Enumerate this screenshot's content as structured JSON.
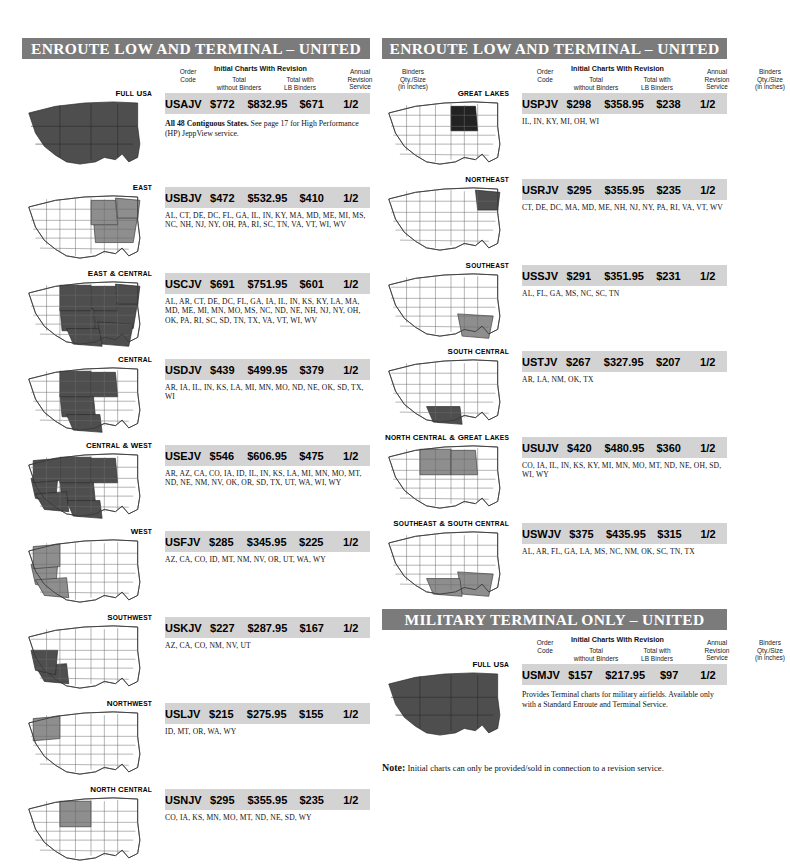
{
  "columns": {
    "header_labels": {
      "order_code": "Order\nCode",
      "order_code_l1": "Order",
      "order_code_l2": "Code",
      "group_title": "Initial Charts With Revision",
      "total_l1": "Total",
      "total_l2": "without  Binders",
      "lb_l1": "Total with",
      "lb_l2": "LB Binders",
      "annual_l1": "Annual",
      "annual_l2": "Revision",
      "annual_l3": "Service",
      "binders_l1": "Binders",
      "binders_l2": "Qty./Size",
      "binders_l3": "(in inches)"
    }
  },
  "sections": [
    {
      "id": "enroute-low-terminal-left",
      "title": "ENROUTE LOW AND TERMINAL – UNITED STATES",
      "items": [
        {
          "region": "Full USA",
          "map": "full-usa",
          "order_code": "USAJV",
          "total_without_binders": "$772",
          "total_with_lb_binders": "$832.95",
          "annual_revision_service": "$671",
          "binders": "1/2",
          "note_bold": "All 48 Contiguous States.",
          "note_rest": " See page 17 for High Performance (HP) JeppView service."
        },
        {
          "region": "East",
          "map": "east",
          "order_code": "USBJV",
          "total_without_binders": "$472",
          "total_with_lb_binders": "$532.95",
          "annual_revision_service": "$410",
          "binders": "1/2",
          "states": "AL, CT, DE, DC, FL, GA, IL, IN, KY, MA, MD, ME, MI, MS, NC, NH, NJ, NY, OH, PA, RI, SC, TN, VA, VT, WI, WV"
        },
        {
          "region": "East & Central",
          "map": "east-central",
          "order_code": "USCJV",
          "total_without_binders": "$691",
          "total_with_lb_binders": "$751.95",
          "annual_revision_service": "$601",
          "binders": "1/2",
          "states": "AL, AR, CT, DE, DC, FL, GA, IA, IL, IN, KS, KY, LA, MA, MD, ME, MI, MN, MO, MS, NC, ND, NE, NH, NJ, NY, OH, OK, PA, RI, SC, SD, TN, TX, VA, VT, WI, WV"
        },
        {
          "region": "Central",
          "map": "central",
          "order_code": "USDJV",
          "total_without_binders": "$439",
          "total_with_lb_binders": "$499.95",
          "annual_revision_service": "$379",
          "binders": "1/2",
          "states": "AR, IA, IL, IN, KS, LA, MI, MN, MO, ND, NE, OK, SD, TX, WI"
        },
        {
          "region": "Central & West",
          "map": "central-west",
          "order_code": "USEJV",
          "total_without_binders": "$546",
          "total_with_lb_binders": "$606.95",
          "annual_revision_service": "$475",
          "binders": "1/2",
          "states": "AR, AZ, CA, CO, IA, ID, IL, IN, KS, LA, MI, MN, MO, MT, ND, NE, NM, NV, OK, OR, SD, TX, UT, WA, WI, WY"
        },
        {
          "region": "West",
          "map": "west",
          "order_code": "USFJV",
          "total_without_binders": "$285",
          "total_with_lb_binders": "$345.95",
          "annual_revision_service": "$225",
          "binders": "1/2",
          "states": "AZ, CA, CO, ID, MT, NM, NV, OR, UT, WA, WY"
        },
        {
          "region": "Southwest",
          "map": "southwest",
          "order_code": "USKJV",
          "total_without_binders": "$227",
          "total_with_lb_binders": "$287.95",
          "annual_revision_service": "$167",
          "binders": "1/2",
          "states": "AZ, CA, CO, NM, NV, UT"
        },
        {
          "region": "Northwest",
          "map": "northwest",
          "order_code": "USLJV",
          "total_without_binders": "$215",
          "total_with_lb_binders": "$275.95",
          "annual_revision_service": "$155",
          "binders": "1/2",
          "states": "ID, MT, OR, WA, WY"
        },
        {
          "region": "North Central",
          "map": "north-central",
          "order_code": "USNJV",
          "total_without_binders": "$295",
          "total_with_lb_binders": "$355.95",
          "annual_revision_service": "$235",
          "binders": "1/2",
          "states": "CO, IA, KS, MN, MO, MT, ND, NE, SD, WY"
        }
      ]
    },
    {
      "id": "enroute-low-terminal-right",
      "title": "ENROUTE LOW AND TERMINAL – UNITED STATES",
      "items": [
        {
          "region": "Great Lakes",
          "map": "great-lakes",
          "order_code": "USPJV",
          "total_without_binders": "$298",
          "total_with_lb_binders": "$358.95",
          "annual_revision_service": "$238",
          "binders": "1/2",
          "states": "IL, IN, KY, MI, OH, WI"
        },
        {
          "region": "Northeast",
          "map": "northeast",
          "order_code": "USRJV",
          "total_without_binders": "$295",
          "total_with_lb_binders": "$355.95",
          "annual_revision_service": "$235",
          "binders": "1/2",
          "states": "CT, DE, DC, MA, MD, ME, NH, NJ, NY, PA, RI, VA, VT, WV"
        },
        {
          "region": "Southeast",
          "map": "southeast",
          "order_code": "USSJV",
          "total_without_binders": "$291",
          "total_with_lb_binders": "$351.95",
          "annual_revision_service": "$231",
          "binders": "1/2",
          "states": "AL, FL, GA, MS, NC, SC, TN"
        },
        {
          "region": "South Central",
          "map": "south-central",
          "order_code": "USTJV",
          "total_without_binders": "$267",
          "total_with_lb_binders": "$327.95",
          "annual_revision_service": "$207",
          "binders": "1/2",
          "states": "AR, LA, NM, OK, TX"
        },
        {
          "region": "North Central & Great Lakes",
          "map": "north-central-great-lakes",
          "order_code": "USUJV",
          "total_without_binders": "$420",
          "total_with_lb_binders": "$480.95",
          "annual_revision_service": "$360",
          "binders": "1/2",
          "states": "CO, IA, IL, IN, KS, KY, MI, MN, MO, MT, ND, NE, OH, SD, WI, WY"
        },
        {
          "region": "Southeast & South Central",
          "map": "southeast-south-central",
          "order_code": "USWJV",
          "total_without_binders": "$375",
          "total_with_lb_binders": "$435.95",
          "annual_revision_service": "$315",
          "binders": "1/2",
          "states": "AL, AR, FL, GA, LA, MS, NC, NM, OK, SC, TN, TX"
        }
      ]
    },
    {
      "id": "military-terminal",
      "title": "MILITARY TERMINAL ONLY – UNITED STATES",
      "items": [
        {
          "region": "Full USA",
          "map": "full-usa",
          "order_code": "USMJV",
          "total_without_binders": "$157",
          "total_with_lb_binders": "$217.95",
          "annual_revision_service": "$97",
          "binders": "1/2",
          "note_bold": "",
          "note_rest": "Provides Terminal charts for military airfields. Available only with a Standard Enroute and Terminal Service."
        }
      ]
    }
  ],
  "footnote": {
    "label": "Note:",
    "text": " Initial charts can only be provided/sold in connection to a revision service."
  },
  "colors": {
    "header_bar": "#7b7b7b",
    "data_bar": "#d3d3d3",
    "map_highlight_dark": "#4e4e4e",
    "map_highlight_mid": "#8e8e8e",
    "map_base": "#ffffff"
  }
}
